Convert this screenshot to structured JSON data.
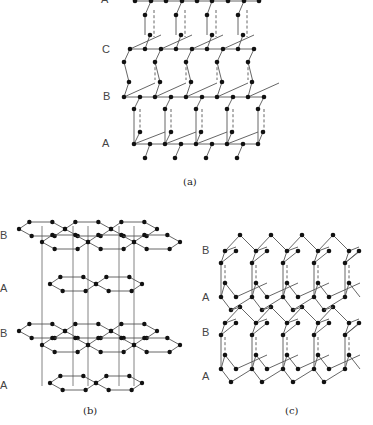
{
  "figure": {
    "panels": [
      {
        "id": "a",
        "caption": "(a)",
        "layer_labels": [
          "A",
          "C",
          "B",
          "A"
        ],
        "description": "Diamond cubic stacking sequence A-C-B-A"
      },
      {
        "id": "b",
        "caption": "(b)",
        "layer_labels": [
          "B",
          "A",
          "B",
          "A"
        ],
        "description": "Graphite-like hexagonal layers stacked A-B-A-B"
      },
      {
        "id": "c",
        "caption": "(c)",
        "layer_labels": [
          "B",
          "A",
          "B",
          "A"
        ],
        "description": "Hexagonal diamond (lonsdaleite) stacking A-B-A-B"
      }
    ]
  },
  "colors": {
    "background": "#ffffff",
    "atom": "#111111",
    "bond": "#555555",
    "label": "#444444"
  }
}
